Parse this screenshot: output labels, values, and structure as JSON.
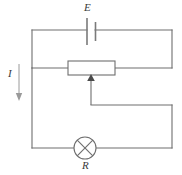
{
  "diagram": {
    "type": "electrical-schematic",
    "width": 182,
    "height": 175,
    "background_color": "#ffffff",
    "wire_color": "#6e6e6e",
    "label_color": "#3a3a3a",
    "arrow_color": "#9a9a9a"
  },
  "labels": {
    "battery": "E",
    "lamp": "R",
    "current": "I"
  },
  "components": [
    {
      "name": "battery-cell",
      "symbol": "cell-two-plate",
      "label": "E",
      "label_position": "above",
      "x": 91,
      "y": 30
    },
    {
      "name": "rheostat",
      "symbol": "variable-resistor-box-with-wiper",
      "label": "",
      "x": 91,
      "y": 68,
      "box": {
        "x": 68,
        "y": 61,
        "width": 47,
        "height": 14
      }
    },
    {
      "name": "lamp",
      "symbol": "lamp-circle-cross",
      "label": "R",
      "label_position": "below",
      "x": 85,
      "y": 148,
      "radius": 11
    },
    {
      "name": "current-direction-arrow",
      "symbol": "arrow-down",
      "label": "I",
      "label_position": "left",
      "x": 19,
      "y_from": 64,
      "y_to": 101
    }
  ],
  "nodes": {
    "outer_left_x": 32,
    "outer_right_x": 172,
    "top_wire_y": 30,
    "mid_wire_y": 68,
    "wiper_branch_y": 105,
    "bottom_wire_y": 148
  },
  "wires": [
    {
      "name": "top-loop-left-vertical",
      "points": "32,30 32,68"
    },
    {
      "name": "top-loop-top-horizontal-left",
      "points": "32,30 87,30"
    },
    {
      "name": "top-loop-top-horizontal-right",
      "points": "95,30 172,30"
    },
    {
      "name": "top-loop-right-vertical",
      "points": "172,30 172,68"
    },
    {
      "name": "rheostat-wire-left",
      "points": "32,68 68,68"
    },
    {
      "name": "rheostat-wire-right",
      "points": "115,68 172,68"
    },
    {
      "name": "wiper-drop",
      "points": "91,82 91,105"
    },
    {
      "name": "wiper-branch-horizontal",
      "points": "91,105 172,105"
    },
    {
      "name": "right-lower-vertical",
      "points": "172,105 172,148"
    },
    {
      "name": "bottom-loop-left-vertical",
      "points": "32,68 32,148"
    },
    {
      "name": "bottom-wire-left",
      "points": "32,148 74,148"
    },
    {
      "name": "bottom-wire-right",
      "points": "96,148 172,148"
    }
  ]
}
